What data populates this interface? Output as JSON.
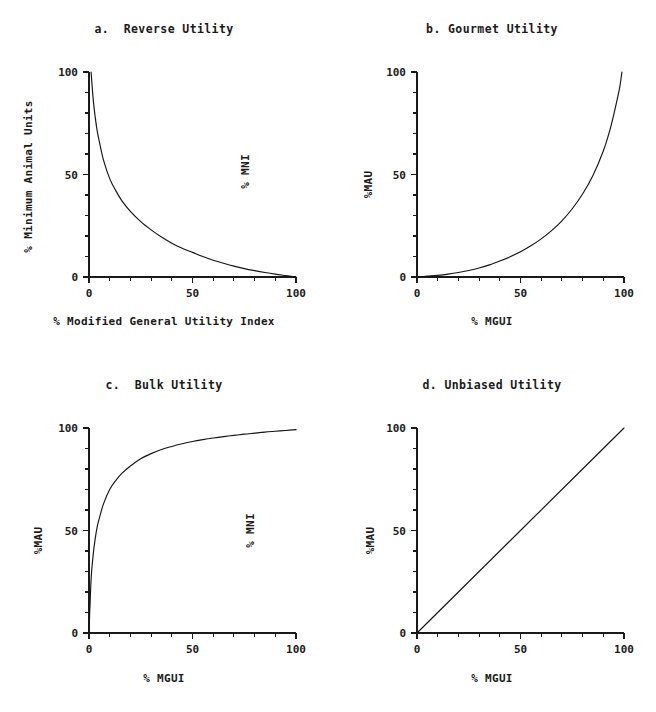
{
  "figure": {
    "background": "#ffffff",
    "ink": "#1a1a1a",
    "panel_count": 4
  },
  "panels": [
    {
      "key": "a",
      "title": "a.  Reverse Utility",
      "ylabel": "% Minimum Animal Units",
      "xlabel": "% Modified General Utility Index",
      "right_label": "% MNI",
      "x_ticks": [
        "0",
        "50",
        "100"
      ],
      "y_ticks": [
        "0",
        "50",
        "100"
      ]
    },
    {
      "key": "b",
      "title": "b. Gourmet Utility",
      "ylabel": "%MAU",
      "xlabel": "% MGUI",
      "right_label": "",
      "x_ticks": [
        "0",
        "50",
        "100"
      ],
      "y_ticks": [
        "0",
        "50",
        "100"
      ]
    },
    {
      "key": "c",
      "title": "c.  Bulk Utility",
      "ylabel": "%MAU",
      "xlabel": "% MGUI",
      "right_label": "% MNI",
      "x_ticks": [
        "0",
        "50",
        "100"
      ],
      "y_ticks": [
        "0",
        "50",
        "100"
      ]
    },
    {
      "key": "d",
      "title": "d. Unbiased Utility",
      "ylabel": "%MAU",
      "xlabel": "% MGUI",
      "right_label": "",
      "x_ticks": [
        "0",
        "50",
        "100"
      ],
      "y_ticks": [
        "0",
        "50",
        "100"
      ]
    }
  ],
  "chart_data": [
    {
      "type": "line",
      "panel": "a",
      "title": "a.  Reverse Utility",
      "xlabel": "% Modified General Utility Index",
      "ylabel": "% Minimum Animal Units",
      "annotation": "% MNI",
      "xlim": [
        0,
        100
      ],
      "ylim": [
        0,
        100
      ],
      "xticks": [
        0,
        50,
        100
      ],
      "yticks": [
        0,
        50,
        100
      ],
      "minor_tick_interval": 10,
      "grid": false,
      "legend": "none",
      "description": "Decreasing convex hyperbolic decay from (1,100) to (100,0)",
      "x": [
        1,
        2,
        3,
        4,
        5,
        7,
        10,
        13,
        16,
        20,
        25,
        30,
        35,
        40,
        45,
        50,
        55,
        60,
        65,
        70,
        75,
        80,
        85,
        90,
        95,
        100
      ],
      "y": [
        100,
        87,
        78,
        71,
        66,
        57,
        48,
        42,
        37,
        32,
        27,
        23,
        19.5,
        16.5,
        14,
        12,
        10,
        8.2,
        6.7,
        5.3,
        4.1,
        3.1,
        2.2,
        1.4,
        0.7,
        0
      ]
    },
    {
      "type": "line",
      "panel": "b",
      "title": "b. Gourmet Utility",
      "xlabel": "% MGUI",
      "ylabel": "%MAU",
      "annotation": "",
      "xlim": [
        0,
        100
      ],
      "ylim": [
        0,
        100
      ],
      "xticks": [
        0,
        50,
        100
      ],
      "yticks": [
        0,
        50,
        100
      ],
      "minor_tick_interval": 10,
      "grid": false,
      "legend": "none",
      "description": "Increasing convex exponential-like rise from (0,0) to (99,100)",
      "x": [
        0,
        5,
        10,
        15,
        20,
        25,
        30,
        35,
        40,
        45,
        50,
        55,
        60,
        65,
        70,
        75,
        80,
        85,
        90,
        93,
        95,
        97,
        98,
        99
      ],
      "y": [
        0,
        0.4,
        0.8,
        1.4,
        2.2,
        3.2,
        4.4,
        5.9,
        7.8,
        9.9,
        12.3,
        15.2,
        18.6,
        22.6,
        27.4,
        33.3,
        40.5,
        49.5,
        61.5,
        71,
        79,
        88,
        93,
        100
      ]
    },
    {
      "type": "line",
      "panel": "c",
      "title": "c.  Bulk Utility",
      "xlabel": "% MGUI",
      "ylabel": "%MAU",
      "annotation": "% MNI",
      "xlim": [
        0,
        100
      ],
      "ylim": [
        0,
        100
      ],
      "xticks": [
        0,
        50,
        100
      ],
      "yticks": [
        0,
        50,
        100
      ],
      "minor_tick_interval": 10,
      "grid": false,
      "legend": "none",
      "description": "Increasing concave saturating rise from (0,0) to (100,99)",
      "x": [
        0,
        1,
        2,
        3,
        4,
        5,
        7,
        10,
        13,
        16,
        20,
        25,
        30,
        35,
        40,
        45,
        50,
        55,
        60,
        65,
        70,
        75,
        80,
        85,
        90,
        95,
        100
      ],
      "y": [
        0,
        26,
        38,
        46,
        52,
        56,
        63,
        70,
        74.5,
        78,
        81.5,
        85,
        87.5,
        89.5,
        91,
        92.3,
        93.4,
        94.3,
        95.1,
        95.8,
        96.4,
        97,
        97.5,
        98,
        98.4,
        98.8,
        99.2
      ]
    },
    {
      "type": "line",
      "panel": "d",
      "title": "d. Unbiased Utility",
      "xlabel": "% MGUI",
      "ylabel": "%MAU",
      "annotation": "",
      "xlim": [
        0,
        100
      ],
      "ylim": [
        0,
        100
      ],
      "xticks": [
        0,
        50,
        100
      ],
      "yticks": [
        0,
        50,
        100
      ],
      "minor_tick_interval": 10,
      "grid": false,
      "legend": "none",
      "description": "Straight identity line from (0,0) to (100,100)",
      "x": [
        0,
        25,
        50,
        75,
        100
      ],
      "y": [
        0,
        25,
        50,
        75,
        100
      ]
    }
  ]
}
